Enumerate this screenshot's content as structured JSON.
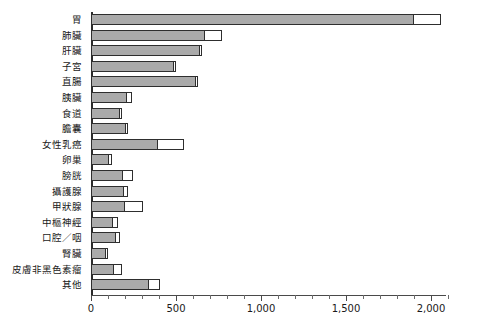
{
  "chart_data": {
    "type": "bar",
    "orientation": "horizontal",
    "title": "",
    "xlabel": "",
    "ylabel": "",
    "xlim": [
      0,
      2110
    ],
    "grid": false,
    "legend_position": "none",
    "stacked": true,
    "categories": [
      "胃",
      "肺臟",
      "肝臟",
      "子宮",
      "直腸",
      "胰臟",
      "食道",
      "膽囊",
      "女性乳癌",
      "卵巢",
      "膀胱",
      "攝護腺",
      "甲狀腺",
      "中樞神經",
      "口腔／咽",
      "腎臟",
      "皮膚非黑色素瘤",
      "其他"
    ],
    "series": [
      {
        "name": "gray-segment",
        "color": "#aaaaaa",
        "values": [
          1900,
          672,
          640,
          492,
          622,
          214,
          172,
          210,
          395,
          110,
          190,
          198,
          200,
          130,
          148,
          88,
          135,
          345
        ]
      },
      {
        "name": "white-segment",
        "color": "#ffffff",
        "values": [
          160,
          100,
          12,
          10,
          8,
          30,
          8,
          10,
          150,
          12,
          55,
          20,
          108,
          26,
          20,
          12,
          50,
          60
        ]
      }
    ],
    "axis_ticks": {
      "major_values": [
        0,
        500,
        1000,
        1500,
        2000
      ],
      "major_labels": [
        "0",
        "500",
        "1,000",
        "1,500",
        "2,000"
      ],
      "minor_step": 100
    }
  },
  "style": {
    "bar_fill": "#aaaaaa",
    "bar_border": "#2e2e2e",
    "segment_fill": "#ffffff",
    "axis_color": "#4a4a4a",
    "text_color": "#1a1a1a",
    "background": "#ffffff"
  }
}
